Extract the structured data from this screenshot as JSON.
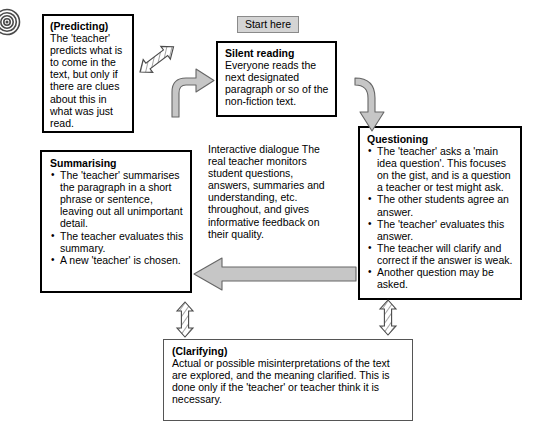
{
  "diagram": {
    "title_hidden": "",
    "icon": "target-spiral-icon",
    "start_label": "Start here",
    "nodes": {
      "predicting": {
        "title": "(Predicting)",
        "body": "The 'teacher' predicts what is to come in the text, but only if there are clues about this in what was just read."
      },
      "silent_reading": {
        "title": "Silent reading",
        "body": "Everyone reads the next designated paragraph or so of the non-fiction text."
      },
      "questioning": {
        "title": "Questioning",
        "bullets": [
          "The 'teacher' asks a 'main idea question'. This focuses on the gist, and is a question a teacher or test might ask.",
          "The other students agree an answer.",
          "The 'teacher' evaluates this answer.",
          "The teacher will clarify and correct if the answer is weak.",
          "Another question may be asked."
        ]
      },
      "summarising": {
        "title": "Summarising",
        "bullets": [
          "The 'teacher' summarises the paragraph in a short phrase or sentence, leaving out all unimportant detail.",
          "The teacher evaluates this summary.",
          "A new 'teacher' is chosen."
        ]
      },
      "clarifying": {
        "title": "(Clarifying)",
        "body": "Actual or possible misinterpretations of the text are explored, and the meaning clarified. This is done only if the 'teacher' or teacher think it is necessary."
      },
      "interactive": {
        "title": "Interactive dialogue",
        "body": "The real teacher monitors student questions, answers, summaries and understanding, etc. throughout, and gives informative feedback on their quality."
      }
    },
    "connectors": [
      {
        "name": "predicting-silentreading-double-arrow",
        "style": "hatched-double-diagonal"
      },
      {
        "name": "silentreading-inflow-curved-arrow",
        "style": "solid-gray-curved"
      },
      {
        "name": "silentreading-questioning-curved-arrow",
        "style": "solid-gray-curved"
      },
      {
        "name": "questioning-summarising-arrow",
        "style": "solid-gray-left"
      },
      {
        "name": "summarising-clarifying-double-arrow",
        "style": "hatched-double-vertical"
      },
      {
        "name": "questioning-clarifying-double-arrow",
        "style": "hatched-double-vertical"
      }
    ],
    "colors": {
      "arrow_fill": "#c8c8c8",
      "arrow_stroke": "#555555",
      "pill_fill": "#d4d4d4",
      "box_border": "#000000"
    }
  }
}
